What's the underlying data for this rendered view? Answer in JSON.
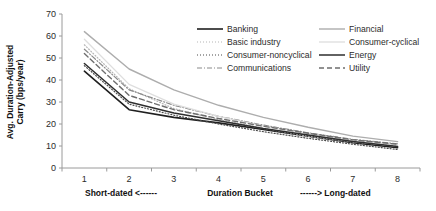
{
  "chart_data": {
    "type": "line",
    "title": "",
    "xlabel": "Duration Bucket",
    "ylabel_line1": "Avg. Duration-Adjusted",
    "ylabel_line2": "Carry (bps/year)",
    "x": [
      1,
      2,
      3,
      4,
      5,
      6,
      7,
      8
    ],
    "xticklabels": [
      "1",
      "2",
      "3",
      "4",
      "5",
      "6",
      "7",
      "8"
    ],
    "yticklabels": [
      "0",
      "10",
      "20",
      "30",
      "40",
      "50",
      "60",
      "70"
    ],
    "yticks": [
      0,
      10,
      20,
      30,
      40,
      50,
      60,
      70
    ],
    "ylim": [
      0,
      70
    ],
    "xlim": [
      0.5,
      8.5
    ],
    "grid": false,
    "legend_position": "upper-right-inside",
    "annotation_left": "Short-dated <------",
    "annotation_right": "------> Long-dated",
    "series": [
      {
        "name": "Banking",
        "style": "solid",
        "color": "#1f1f1f",
        "width": 1.6,
        "dash": "none",
        "values": [
          44.0,
          26.5,
          23.0,
          20.5,
          17.5,
          14.5,
          11.5,
          9.2
        ]
      },
      {
        "name": "Basic industry",
        "style": "dotted",
        "color": "#b5b5b5",
        "width": 1.2,
        "dash": "1,2",
        "values": [
          56.0,
          36.0,
          27.0,
          22.0,
          18.0,
          14.5,
          11.8,
          10.0
        ]
      },
      {
        "name": "Consumer-noncyclical",
        "style": "dotted",
        "color": "#4a4a4a",
        "width": 1.2,
        "dash": "1,2",
        "values": [
          46.5,
          29.0,
          24.0,
          20.0,
          16.5,
          13.5,
          10.8,
          8.4
        ]
      },
      {
        "name": "Communications",
        "style": "dashdot",
        "color": "#8a8a8a",
        "width": 1.2,
        "dash": "5,2,1,2",
        "values": [
          54.0,
          35.5,
          28.5,
          23.5,
          19.5,
          16.0,
          13.0,
          11.0
        ]
      },
      {
        "name": "Financial",
        "style": "solid",
        "color": "#adadad",
        "width": 1.4,
        "dash": "none",
        "values": [
          62.0,
          45.0,
          35.5,
          28.5,
          23.0,
          18.5,
          14.5,
          12.0
        ]
      },
      {
        "name": "Consumer-cyclical",
        "style": "solid",
        "color": "#dedede",
        "width": 1.3,
        "dash": "none",
        "values": [
          58.5,
          38.0,
          29.0,
          23.5,
          19.0,
          15.5,
          12.5,
          10.5
        ]
      },
      {
        "name": "Energy",
        "style": "solid",
        "color": "#2e2e2e",
        "width": 1.5,
        "dash": "none",
        "values": [
          47.5,
          30.0,
          25.0,
          21.5,
          18.0,
          15.0,
          12.0,
          9.8
        ]
      },
      {
        "name": "Utility",
        "style": "dashed",
        "color": "#6e6e6e",
        "width": 1.4,
        "dash": "5,3",
        "values": [
          52.0,
          33.0,
          26.5,
          22.5,
          19.0,
          15.8,
          12.8,
          10.8
        ]
      }
    ]
  },
  "legend": {
    "entries": [
      {
        "label": "Banking"
      },
      {
        "label": "Financial"
      },
      {
        "label": "Basic industry"
      },
      {
        "label": "Consumer-cyclical"
      },
      {
        "label": "Consumer-noncyclical"
      },
      {
        "label": "Energy"
      },
      {
        "label": "Communications"
      },
      {
        "label": "Utility"
      }
    ]
  }
}
